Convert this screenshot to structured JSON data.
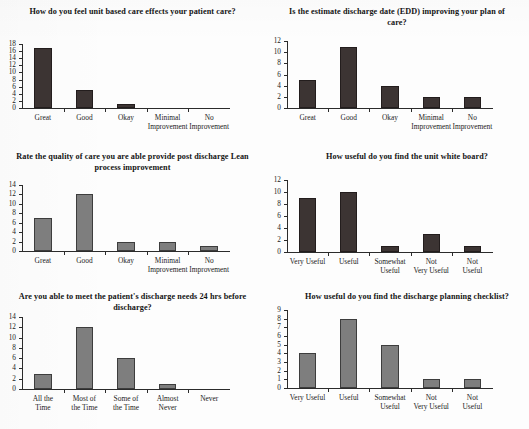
{
  "page": {
    "background": "#fdfdfd",
    "bar_color_dark": "#3c3433",
    "bar_color_gray": "#7e7e7e",
    "axis_color": "#2b2b2b"
  },
  "charts": [
    {
      "id": "chart-unit-based-care",
      "title": "How do you feel unit based care effects\nyour patient care?",
      "title_lines": [
        "How do you feel unit based care effects",
        "your patient care?"
      ],
      "bar_style": "dark",
      "chart_data": {
        "type": "bar",
        "title": "How do you feel unit based care effects your patient care?",
        "categories": [
          "Great",
          "Good",
          "Okay",
          "Minimal\nImprovement",
          "No\nImprovement"
        ],
        "values": [
          17,
          5,
          1,
          0,
          0
        ],
        "xlabel": "",
        "ylabel": "",
        "ylim": [
          0,
          18
        ],
        "ytick_step": 2,
        "yticks": [
          0,
          2,
          4,
          6,
          8,
          10,
          12,
          14,
          16,
          18
        ],
        "grid": false,
        "legend": false
      }
    },
    {
      "id": "chart-edd-plan-of-care",
      "title": "Is the estimate discharge date (EDD) improving\nyour plan of care?",
      "title_lines": [
        "Is the estimate discharge date (EDD) improving",
        "your plan of care?"
      ],
      "bar_style": "dark",
      "chart_data": {
        "type": "bar",
        "title": "Is the estimate discharge date (EDD) improving your plan of care?",
        "categories": [
          "Great",
          "Good",
          "Okay",
          "Minimal\nImprovement",
          "No\nImprovement"
        ],
        "values": [
          5,
          11,
          4,
          2,
          2
        ],
        "xlabel": "",
        "ylabel": "",
        "ylim": [
          0,
          12
        ],
        "ytick_step": 2,
        "yticks": [
          0,
          2,
          4,
          6,
          8,
          10,
          12
        ],
        "grid": false,
        "legend": false
      }
    },
    {
      "id": "chart-quality-of-care-lean",
      "title": "Rate the quality of care you are able provide post\ndischarge Lean process improvement",
      "title_lines": [
        "Rate the quality of care you are able provide post",
        "discharge Lean process improvement"
      ],
      "bar_style": "gray",
      "chart_data": {
        "type": "bar",
        "title": "Rate the quality of care you are able provide post discharge Lean process improvement",
        "categories": [
          "Great",
          "Good",
          "Okay",
          "Minimal\nImprovement",
          "No\nImprovement"
        ],
        "values": [
          7,
          12,
          2,
          2,
          1
        ],
        "xlabel": "",
        "ylabel": "",
        "ylim": [
          0,
          14
        ],
        "ytick_step": 2,
        "yticks": [
          0,
          2,
          4,
          6,
          8,
          10,
          12,
          14
        ],
        "grid": false,
        "legend": false
      }
    },
    {
      "id": "chart-unit-white-board",
      "title": "How useful do you find the unit white board?",
      "title_lines": [
        "How useful do you find the unit white board?"
      ],
      "bar_style": "dark",
      "chart_data": {
        "type": "bar",
        "title": "How useful do you find the unit white board?",
        "categories": [
          "Very Useful",
          "Useful",
          "Somewhat\nUseful",
          "Not\nVery Useful",
          "Not\nUseful"
        ],
        "values": [
          9,
          10,
          1,
          3,
          1
        ],
        "xlabel": "",
        "ylabel": "",
        "ylim": [
          0,
          12
        ],
        "ytick_step": 2,
        "yticks": [
          0,
          2,
          4,
          6,
          8,
          10,
          12
        ],
        "grid": false,
        "legend": false
      }
    },
    {
      "id": "chart-discharge-needs-24hrs",
      "title": "Are you able to meet the patient's discharge\nneeds 24 hrs before discharge?",
      "title_lines": [
        "Are you able to meet the patient's discharge",
        "needs 24 hrs before discharge?"
      ],
      "bar_style": "gray",
      "chart_data": {
        "type": "bar",
        "title": "Are you able to meet the patient's discharge needs 24 hrs before discharge?",
        "categories": [
          "All the\nTime",
          "Most of\nthe Time",
          "Some of\nthe Time",
          "Almost\nNever",
          "Never"
        ],
        "values": [
          3,
          12,
          6,
          1,
          0
        ],
        "xlabel": "",
        "ylabel": "",
        "ylim": [
          0,
          14
        ],
        "ytick_step": 2,
        "yticks": [
          0,
          2,
          4,
          6,
          8,
          10,
          12,
          14
        ],
        "grid": false,
        "legend": false
      }
    },
    {
      "id": "chart-discharge-planning-checklist",
      "title": "How useful do you find the discharge planning checklist?",
      "title_lines": [
        "How useful do you find the discharge planning checklist?"
      ],
      "bar_style": "gray",
      "chart_data": {
        "type": "bar",
        "title": "How useful do you find the discharge planning checklist?",
        "categories": [
          "Very Useful",
          "Useful",
          "Somewhat\nUseful",
          "Not\nVery Useful",
          "Not\nUseful"
        ],
        "values": [
          4,
          8,
          5,
          1,
          1
        ],
        "xlabel": "",
        "ylabel": "",
        "ylim": [
          0,
          9
        ],
        "ytick_step": 1,
        "yticks": [
          0,
          1,
          2,
          3,
          4,
          5,
          6,
          7,
          8,
          9
        ],
        "grid": false,
        "legend": false
      }
    }
  ]
}
